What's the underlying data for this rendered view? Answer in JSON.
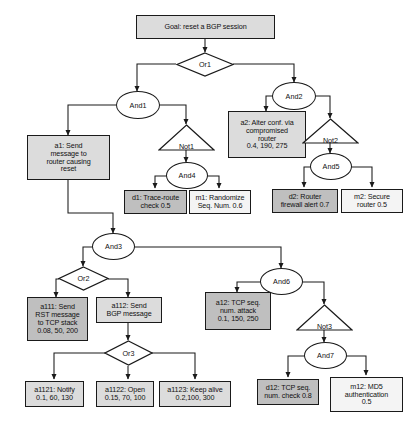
{
  "diagram": {
    "colors": {
      "attack_node_fill": "#dcdcdc",
      "detection_node_fill": "#bfbfbf",
      "mitigation_node_fill": "#f4f4f4",
      "gate_fill": "#ffffff",
      "stroke": "#1a1a1a",
      "background": "#ffffff"
    },
    "nodes": {
      "goal": {
        "label": "Goal: reset a BGP session",
        "kind": "goal-box"
      },
      "or1": {
        "label": "Or1",
        "kind": "or-gate"
      },
      "and1": {
        "label": "And1",
        "kind": "and-gate"
      },
      "and2": {
        "label": "And2",
        "kind": "and-gate"
      },
      "not1": {
        "label": "Not1",
        "kind": "not-gate"
      },
      "not2": {
        "label": "Not2",
        "kind": "not-gate"
      },
      "and4": {
        "label": "And4",
        "kind": "and-gate"
      },
      "and5": {
        "label": "And5",
        "kind": "and-gate"
      },
      "and3": {
        "label": "And3",
        "kind": "and-gate"
      },
      "or2": {
        "label": "Or2",
        "kind": "or-gate"
      },
      "or3": {
        "label": "Or3",
        "kind": "or-gate"
      },
      "and6": {
        "label": "And6",
        "kind": "and-gate"
      },
      "not3": {
        "label": "Not3",
        "kind": "not-gate"
      },
      "and7": {
        "label": "And7",
        "kind": "and-gate"
      },
      "a1": {
        "label": "a1: Send\nmessage to\nrouter causing\nreset",
        "kind": "attack-box"
      },
      "a2": {
        "label": "a2: Alter conf. via\ncompromised\nrouter\n0.4, 190, 275",
        "kind": "attack-box"
      },
      "d1": {
        "label": "d1: Trace-route\ncheck 0.5",
        "kind": "detection-box"
      },
      "m1": {
        "label": "m1: Randomize\nSeq. Num. 0.6",
        "kind": "mitigation-box"
      },
      "d2": {
        "label": "d2: Router\nfirewall alert 0.7",
        "kind": "detection-box"
      },
      "m2": {
        "label": "m2: Secure\nrouter 0.5",
        "kind": "mitigation-box"
      },
      "a111": {
        "label": "a111: Send\nRST message\nto TCP stack\n0.08, 50, 200",
        "kind": "attack-box"
      },
      "a112": {
        "label": "a112: Send\nBGP message",
        "kind": "attack-box"
      },
      "a12": {
        "label": "a12: TCP seq.\nnum. attack\n0.1, 150, 250",
        "kind": "attack-box"
      },
      "a1121": {
        "label": "a1121:  Notify\n0.1, 60, 130",
        "kind": "attack-box"
      },
      "a1122": {
        "label": "a1122: Open\n0.15, 70, 100",
        "kind": "attack-box"
      },
      "a1123": {
        "label": "a1123: Keep alive\n0.2,100, 300",
        "kind": "attack-box"
      },
      "d12": {
        "label": "d12: TCP seq.\nnum. check 0.8",
        "kind": "detection-box"
      },
      "m12": {
        "label": "m12: MD5\nauthentication\n0.5",
        "kind": "mitigation-box"
      }
    },
    "edges": [
      {
        "from": "goal",
        "to": "or1"
      },
      {
        "from": "or1",
        "to": "and1"
      },
      {
        "from": "or1",
        "to": "and2"
      },
      {
        "from": "and1",
        "to": "a1"
      },
      {
        "from": "and1",
        "to": "not1"
      },
      {
        "from": "not1",
        "to": "and4"
      },
      {
        "from": "and4",
        "to": "d1"
      },
      {
        "from": "and4",
        "to": "m1"
      },
      {
        "from": "and2",
        "to": "a2"
      },
      {
        "from": "and2",
        "to": "not2"
      },
      {
        "from": "not2",
        "to": "and5"
      },
      {
        "from": "and5",
        "to": "d2"
      },
      {
        "from": "and5",
        "to": "m2"
      },
      {
        "from": "a1",
        "to": "and3"
      },
      {
        "from": "and3",
        "to": "or2"
      },
      {
        "from": "and3",
        "to": "and6"
      },
      {
        "from": "or2",
        "to": "a111"
      },
      {
        "from": "or2",
        "to": "a112"
      },
      {
        "from": "a112",
        "to": "or3"
      },
      {
        "from": "or3",
        "to": "a1121"
      },
      {
        "from": "or3",
        "to": "a1122"
      },
      {
        "from": "or3",
        "to": "a1123"
      },
      {
        "from": "and6",
        "to": "a12"
      },
      {
        "from": "and6",
        "to": "not3"
      },
      {
        "from": "not3",
        "to": "and7"
      },
      {
        "from": "and7",
        "to": "d12"
      },
      {
        "from": "and7",
        "to": "m12"
      }
    ]
  }
}
